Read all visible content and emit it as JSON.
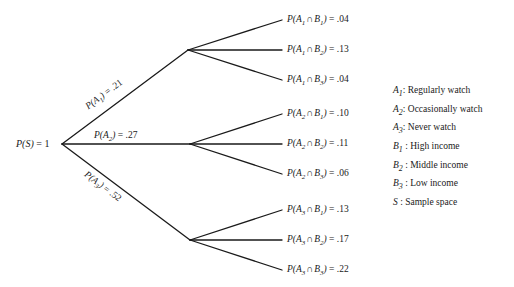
{
  "diagram": {
    "type": "probability-tree",
    "root": {
      "label_sym": "P(S)",
      "label_eq": " = 1"
    },
    "level1": [
      {
        "sym": "P(A",
        "sub": "1",
        "close": ")",
        "eq": " = .21",
        "full": "P(A1) = .21"
      },
      {
        "sym": "P(A",
        "sub": "2",
        "close": ")",
        "eq": " = .27",
        "full": "P(A2) = .27"
      },
      {
        "sym": "P(A",
        "sub": "3",
        "close": ")",
        "eq": " = .52",
        "full": "P(A3) = .52"
      }
    ],
    "leaves": [
      {
        "a": "1",
        "b": "1",
        "value": ".04"
      },
      {
        "a": "1",
        "b": "2",
        "value": ".13"
      },
      {
        "a": "1",
        "b": "3",
        "value": ".04"
      },
      {
        "a": "2",
        "b": "1",
        "value": ".10"
      },
      {
        "a": "2",
        "b": "2",
        "value": ".11"
      },
      {
        "a": "2",
        "b": "3",
        "value": ".06"
      },
      {
        "a": "3",
        "b": "1",
        "value": ".13"
      },
      {
        "a": "3",
        "b": "2",
        "value": ".17"
      },
      {
        "a": "3",
        "b": "3",
        "value": ".22"
      }
    ],
    "legend": [
      {
        "sym": "A",
        "sub": "1",
        "sep": ": ",
        "text": "Regularly watch"
      },
      {
        "sym": "A",
        "sub": "2",
        "sep": ": ",
        "text": "Occasionally watch"
      },
      {
        "sym": "A",
        "sub": "3",
        "sep": ": ",
        "text": "Never watch"
      },
      {
        "sym": "B",
        "sub": "1",
        "sep": " : ",
        "text": "High income"
      },
      {
        "sym": "B",
        "sub": "2",
        "sep": " : ",
        "text": "Middle income"
      },
      {
        "sym": "B",
        "sub": "3",
        "sep": " : ",
        "text": "Low income"
      },
      {
        "sym": "S",
        "sub": "",
        "sep": " : ",
        "text": "Sample space"
      }
    ],
    "colors": {
      "line": "#1a1a1a",
      "text": "#1a1a1a",
      "background": "#ffffff"
    }
  }
}
